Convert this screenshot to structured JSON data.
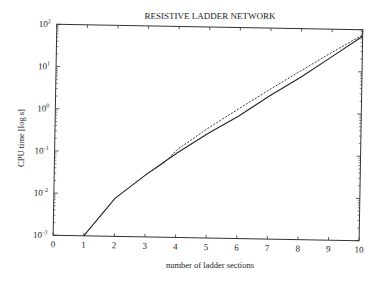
{
  "chart_data": {
    "type": "line",
    "title": "RESISTIVE LADDER NETWORK",
    "xlabel": "number of ladder sections",
    "ylabel": "CPU time [log s]",
    "xlim": [
      0,
      10
    ],
    "ylim": [
      0.001,
      100
    ],
    "yscale": "log",
    "grid": false,
    "legend": null,
    "x_ticks": [
      "0",
      "1",
      "2",
      "3",
      "4",
      "5",
      "6",
      "7",
      "8",
      "9",
      "10"
    ],
    "y_ticks": [
      {
        "base": "10",
        "exp": "-3",
        "value": 0.001
      },
      {
        "base": "10",
        "exp": "-2",
        "value": 0.01
      },
      {
        "base": "10",
        "exp": "-1",
        "value": 0.1
      },
      {
        "base": "10",
        "exp": "0",
        "value": 1
      },
      {
        "base": "10",
        "exp": "1",
        "value": 10
      },
      {
        "base": "10",
        "exp": "2",
        "value": 100
      }
    ],
    "series": [
      {
        "name": "solid",
        "style": "solid",
        "x": [
          1,
          2,
          3,
          4,
          5,
          6,
          7,
          8,
          9,
          10
        ],
        "values": [
          0.001,
          0.008,
          0.03,
          0.1,
          0.3,
          0.8,
          2.5,
          7,
          22,
          70
        ]
      },
      {
        "name": "dashed",
        "style": "dashed",
        "x": [
          3,
          3.6,
          4,
          5,
          6,
          7,
          8,
          9,
          10
        ],
        "values": [
          0.03,
          0.06,
          0.12,
          0.4,
          1.2,
          3.5,
          10,
          28,
          75
        ]
      }
    ]
  }
}
